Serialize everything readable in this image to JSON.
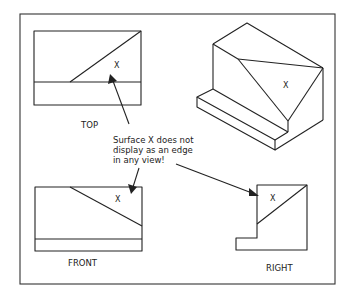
{
  "figure": {
    "views": {
      "top": {
        "label": "TOP",
        "surface_mark": "X"
      },
      "front": {
        "label": "FRONT",
        "surface_mark": "X"
      },
      "right": {
        "label": "RIGHT",
        "surface_mark": "X"
      },
      "isometric": {
        "surface_mark": "X"
      }
    },
    "annotation": {
      "lines": [
        "Surface X does not",
        "display as an edge",
        "in any view!"
      ]
    },
    "colors": {
      "line": "#222222",
      "background": "#ffffff"
    }
  }
}
